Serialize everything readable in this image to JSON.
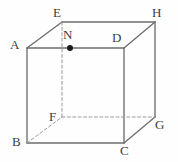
{
  "figure": {
    "kind": "cube-solid-geometry-diagram",
    "width": 178,
    "height": 162,
    "background_color": "#fefefe",
    "edge_color": "#6e6e6e",
    "hidden_edge_color": "#9a9a9a",
    "label_color": "#3d3d3d",
    "point_color": "#1a1a1a"
  },
  "labels": {
    "A": "A",
    "B": "B",
    "C": "C",
    "D": "D",
    "E": "E",
    "F": "F",
    "G": "G",
    "H": "H",
    "N": "N"
  },
  "chart_data": {
    "type": "scatter",
    "title": "",
    "xlabel": "",
    "ylabel": "",
    "grid": false,
    "legend": "none",
    "vertices": [
      {
        "name": "A",
        "x": 27,
        "y": 48,
        "role": "front-top-left",
        "hidden": false,
        "label_x": 10,
        "label_y": 38
      },
      {
        "name": "D",
        "x": 124,
        "y": 48,
        "role": "front-top-right",
        "hidden": false,
        "label_x": 112,
        "label_y": 31
      },
      {
        "name": "B",
        "x": 27,
        "y": 143,
        "role": "front-bottom-left",
        "hidden": false,
        "label_x": 12,
        "label_y": 135
      },
      {
        "name": "C",
        "x": 124,
        "y": 143,
        "role": "front-bottom-right",
        "hidden": false,
        "label_x": 120,
        "label_y": 144
      },
      {
        "name": "E",
        "x": 62,
        "y": 22,
        "role": "back-top-left",
        "hidden": false,
        "label_x": 53,
        "label_y": 6
      },
      {
        "name": "H",
        "x": 155,
        "y": 22,
        "role": "back-top-right",
        "hidden": false,
        "label_x": 152,
        "label_y": 6
      },
      {
        "name": "F",
        "x": 62,
        "y": 117,
        "role": "back-bottom-left",
        "hidden": true,
        "label_x": 49,
        "label_y": 110
      },
      {
        "name": "G",
        "x": 155,
        "y": 117,
        "role": "back-bottom-right",
        "hidden": false,
        "label_x": 155,
        "label_y": 118
      }
    ],
    "points": [
      {
        "name": "N",
        "x": 70,
        "y": 48,
        "on_edge": "AD",
        "marker": "filled-circle",
        "radius": 3,
        "label_x": 63,
        "label_y": 28
      }
    ],
    "edges": [
      {
        "from": "A",
        "to": "D",
        "hidden": false
      },
      {
        "from": "A",
        "to": "B",
        "hidden": false
      },
      {
        "from": "B",
        "to": "C",
        "hidden": false
      },
      {
        "from": "D",
        "to": "C",
        "hidden": false
      },
      {
        "from": "E",
        "to": "H",
        "hidden": false
      },
      {
        "from": "H",
        "to": "G",
        "hidden": false
      },
      {
        "from": "G",
        "to": "C",
        "hidden": false
      },
      {
        "from": "D",
        "to": "H",
        "hidden": false
      },
      {
        "from": "A",
        "to": "E",
        "hidden": false
      },
      {
        "from": "E",
        "to": "F",
        "hidden": true
      },
      {
        "from": "F",
        "to": "G",
        "hidden": true
      },
      {
        "from": "B",
        "to": "F",
        "hidden": true
      }
    ]
  }
}
